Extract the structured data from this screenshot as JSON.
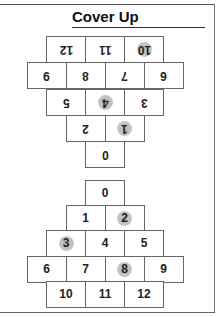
{
  "title": "Cover Up",
  "colors": {
    "cover_marker": "#bdbdbd",
    "grid_line": "#666666",
    "text": "#222222"
  },
  "top_board": {
    "orientation": "upside-down",
    "rows": [
      [
        {
          "label": "12",
          "covered": false
        },
        {
          "label": "11",
          "covered": false
        },
        {
          "label": "10",
          "covered": true
        }
      ],
      [
        {
          "label": "9",
          "covered": false
        },
        {
          "label": "8",
          "covered": false
        },
        {
          "label": "7",
          "covered": false
        },
        {
          "label": "6",
          "covered": false
        }
      ],
      [
        {
          "label": "5",
          "covered": false
        },
        {
          "label": "4",
          "covered": true
        },
        {
          "label": "3",
          "covered": false
        }
      ],
      [
        {
          "label": "2",
          "covered": false
        },
        {
          "label": "1",
          "covered": true
        }
      ],
      [
        {
          "label": "0",
          "covered": false
        }
      ]
    ]
  },
  "bottom_board": {
    "orientation": "upright",
    "rows": [
      [
        {
          "label": "0",
          "covered": false
        }
      ],
      [
        {
          "label": "1",
          "covered": false
        },
        {
          "label": "2",
          "covered": true
        }
      ],
      [
        {
          "label": "3",
          "covered": true
        },
        {
          "label": "4",
          "covered": false
        },
        {
          "label": "5",
          "covered": false
        }
      ],
      [
        {
          "label": "6",
          "covered": false
        },
        {
          "label": "7",
          "covered": false
        },
        {
          "label": "8",
          "covered": true
        },
        {
          "label": "9",
          "covered": false
        }
      ],
      [
        {
          "label": "10",
          "covered": false
        },
        {
          "label": "11",
          "covered": false
        },
        {
          "label": "12",
          "covered": false
        }
      ]
    ]
  }
}
